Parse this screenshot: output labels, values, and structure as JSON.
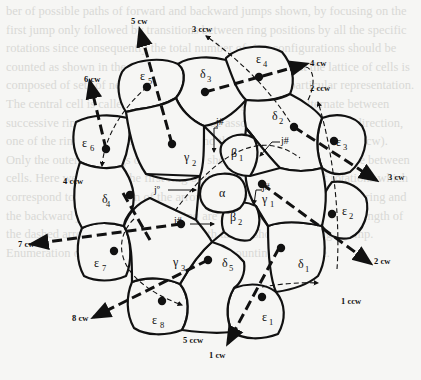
{
  "figure": {
    "background_text": "ber of possible paths of forward and backward jumps shown, by focusing on the first jump only followed by transitions between ring positions by all the specific rotations since consequently the total number of ring configurations should be counted as shown in the figure above. The figure shows that the lattice of cells is composed of sets of neighbors which are compiled for a particular representation. The central cell is called the origin, and the neighbors of it alternate between successive rings of cells. Each jump can be associated with a rotation direction, one of the rings being clockwise (cw) and the other counterclockwise (ccw). Only the outermost rings of the grid are shown, and the jumps are made between cells. Here we consider the first ring of the grid and a number of rotations which correspond to the direction of the arrows; the forward jumps in the first ring and the backward jumps in the second ring are drawn as dashed lines. The length of the dashed arrows is the length of the path taken, shown as a single jump. Enumeration of configurations is based on a counting procedure.",
    "cells": {
      "center": {
        "symbol": "α",
        "sub": ""
      },
      "beta1": {
        "symbol": "β",
        "sub": "1"
      },
      "beta2": {
        "symbol": "β",
        "sub": "2"
      },
      "gamma1": {
        "symbol": "γ",
        "sub": "1"
      },
      "gamma2": {
        "symbol": "γ",
        "sub": "2"
      },
      "gamma3": {
        "symbol": "γ",
        "sub": "3"
      },
      "delta1": {
        "symbol": "δ",
        "sub": "1"
      },
      "delta2": {
        "symbol": "δ",
        "sub": "2"
      },
      "delta3": {
        "symbol": "δ",
        "sub": "3"
      },
      "delta4": {
        "symbol": "δ",
        "sub": "4"
      },
      "delta5": {
        "symbol": "δ",
        "sub": "5"
      },
      "eps1": {
        "symbol": "ε",
        "sub": "1"
      },
      "eps2": {
        "symbol": "ε",
        "sub": "2"
      },
      "eps3": {
        "symbol": "ε",
        "sub": "3"
      },
      "eps4": {
        "symbol": "ε",
        "sub": "4"
      },
      "eps5": {
        "symbol": "ε",
        "sub": "5"
      },
      "eps6": {
        "symbol": "ε",
        "sub": "6"
      },
      "eps7": {
        "symbol": "ε",
        "sub": "7"
      },
      "eps8": {
        "symbol": "ε",
        "sub": "8"
      }
    },
    "junctions": {
      "j1": "j#",
      "j2": "j#",
      "j3": "j#",
      "j4": "j#",
      "j_origin": "jº"
    },
    "arrows": {
      "a1cw": "1 cw",
      "a1ccw": "1 ccw",
      "a2cw": "2 cw",
      "a2ccw": "2 ccw",
      "a3cw": "3 cw",
      "a3ccw": "3 ccw",
      "a4cw": "4 cw",
      "a4ccw": "4 ccw",
      "a5cw": "5 cw",
      "a5ccw": "5 ccw",
      "a6cw": "6 cw",
      "a7cw": "7 cw",
      "a8cw": "8 cw"
    }
  }
}
